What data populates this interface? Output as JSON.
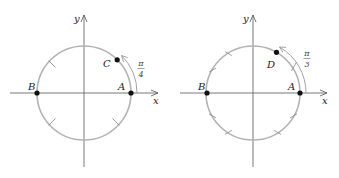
{
  "colors": {
    "axis": "#555555",
    "circle": "#b3b3b3",
    "point": "#111111",
    "arc": "#9a9a9a",
    "text": "#222222"
  },
  "diagrams": [
    {
      "id": "left",
      "center": [
        84,
        93
      ],
      "radius": 47,
      "axis_labels": {
        "x": "x",
        "y": "y"
      },
      "points": [
        {
          "name": "A",
          "label": "A",
          "angle_deg": 0
        },
        {
          "name": "B",
          "label": "B",
          "angle_deg": 180
        },
        {
          "name": "C",
          "label": "C",
          "angle_deg": 45
        }
      ],
      "tick_angles_deg": [
        135,
        225,
        315
      ],
      "arc_label": {
        "numerator": "π",
        "denominator": "4"
      }
    },
    {
      "id": "right",
      "center": [
        253,
        93
      ],
      "radius": 47,
      "axis_labels": {
        "x": "x",
        "y": "y"
      },
      "points": [
        {
          "name": "A",
          "label": "A",
          "angle_deg": 0
        },
        {
          "name": "B",
          "label": "B",
          "angle_deg": 180
        },
        {
          "name": "D",
          "label": "D",
          "angle_deg": 60
        }
      ],
      "tick_angles_deg": [
        30,
        120,
        150,
        210,
        240,
        300,
        330
      ],
      "arc_label": {
        "numerator": "π",
        "denominator": "3"
      }
    }
  ]
}
